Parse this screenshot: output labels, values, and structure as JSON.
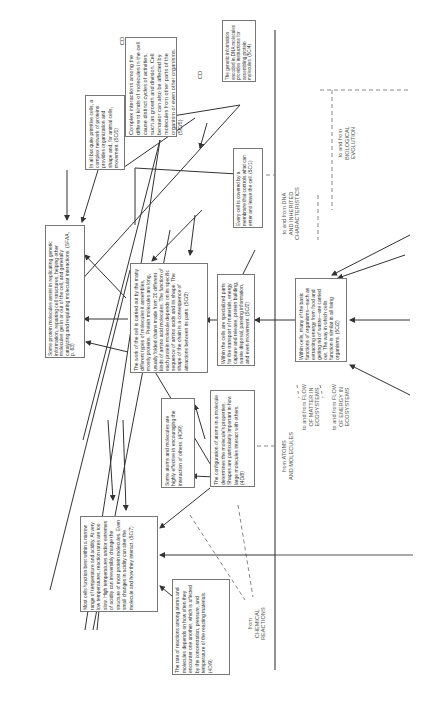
{
  "diagram": {
    "cd_marker": "CD",
    "boxes": [
      {
        "id": "complex-interactions",
        "text": "Complex interactions among the different kinds of molecules in the cell cause distinct cycles of activities, such as growth and division. Cell behavior can also be affected by molecules from other parts of the organism or even other organisms. (5C/5)"
      },
      {
        "id": "genetic-information",
        "text": "The genetic information encoded in DNA molecules provides instructions for assembling protein molecules. (5C/4)"
      },
      {
        "id": "primitive-cells",
        "text": "In all but quite primitive cells, a complex network of proteins provides organization and shape and, for animal cells, movement. (5C/1)"
      },
      {
        "id": "membrane",
        "text": "Every cell is covered by a membrane that controls what can enter and leave the cell. (5C/1)"
      },
      {
        "id": "protein-molecules-assist",
        "text": "Some protein molecules assist in replicating genetic information, repairing cell structures, helping other molecules get in or out of the cell, and generally catalyzing and regulating molecular interactions. (SFAA, p. 63)"
      },
      {
        "id": "work-of-cell",
        "text": "The work of the cell is carried out by the many different types of molecules it assembles, mostly proteins. Protein molecules are long, usually folded chains made from 20 different kinds of amino acid molecules. The function of each protein molecule depends on its specific sequence of amino acids and its shape. The shape of the chain is a consequence of attractions between its parts. (5C/3)"
      },
      {
        "id": "specialized-parts",
        "text": "Within the cells are specialized parts for the transport of materials, energy capture and release, protein building, waste disposal, passing information, and even movement. (5C/2)"
      },
      {
        "id": "basic-functions",
        "text": "Within cells, many of the basic functions of organisms—such as extracting energy from food and getting rid of waste—are carried out. The way in which cells function is similar in all living organisms. (5C/2)"
      },
      {
        "id": "atoms-encouraging",
        "text": "Some atoms and molecules are highly effective in encouraging the interaction of others. (4D/9)"
      },
      {
        "id": "configuration-atoms",
        "text": "The configuration of atoms in a molecule determines the molecule's properties. Shapes are particularly important in how large molecules interact with others. (4D/8)"
      },
      {
        "id": "temperature-acidity",
        "text": "Most cells function best within a narrow range of temperature and acidity. At very low temperatures, reaction rates are too slow. High temperatures and/or extremes of acidity can irreversibly change the structure of most protein molecules. Even small changes in acidity can alter the molecule and how they interact. (5C/7)"
      },
      {
        "id": "reaction-rate",
        "text": "The rate of reactions among atoms and molecules depends on how often they encounter one another, which is affected by the concentration, pressure, and temperature of the reacting materials. (4D/9)"
      }
    ],
    "labels": [
      {
        "id": "biological-evolution",
        "lines": [
          "to and from",
          "BIOLOGICAL",
          "EVOLUTION"
        ]
      },
      {
        "id": "dna-inherited",
        "lines": [
          "to and from DNA",
          "AND INHERITED",
          "CHARACTERISTICS"
        ]
      },
      {
        "id": "atoms-molecules",
        "lines": [
          "from ATOMS",
          "AND MOLECULES"
        ]
      },
      {
        "id": "flow-of-matter",
        "lines": [
          "to and from FLOW",
          "OF MATTER IN",
          "ECOSYSTEMS"
        ]
      },
      {
        "id": "flow-of-energy",
        "lines": [
          "to and from FLOW",
          "OF ENERGY IN",
          "ECOSYSTEMS"
        ]
      },
      {
        "id": "chemical-reactions",
        "lines": [
          "from",
          "CHEMICAL",
          "REACTIONS"
        ]
      }
    ]
  }
}
